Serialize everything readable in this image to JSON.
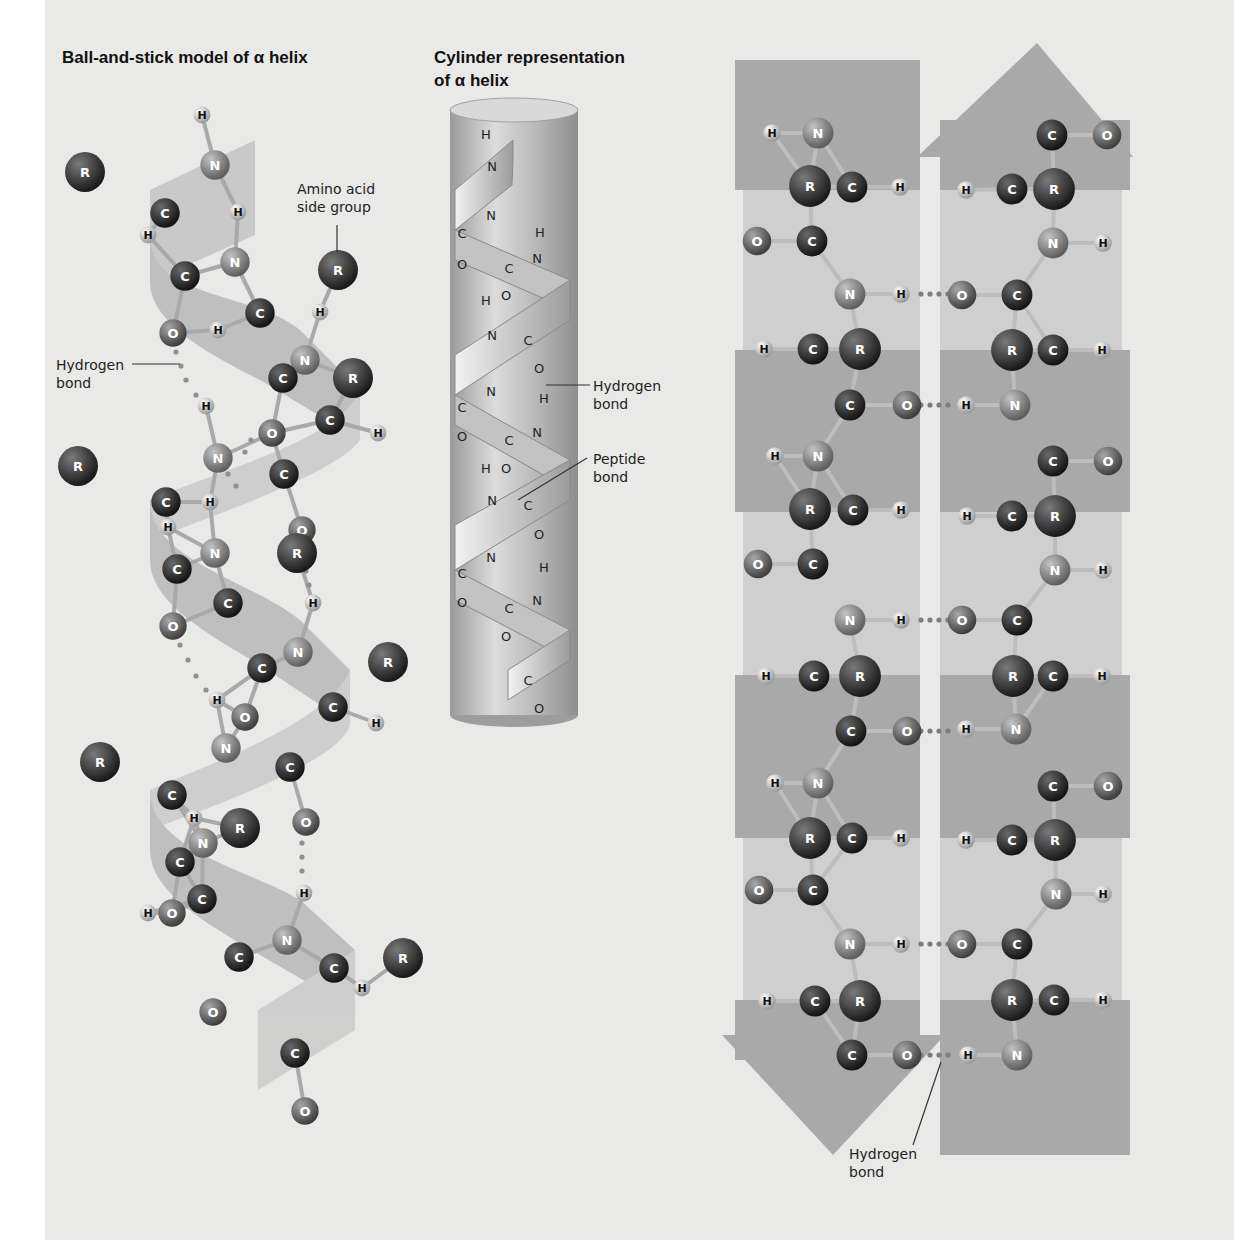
{
  "figure": {
    "panel_color": "#e9e9e8",
    "colors": {
      "carbon": "#2b2b2b",
      "nitrogen": "#8a8a8a",
      "oxygen": "#6e6e6e",
      "r_group": "#3a3a3a",
      "hydrogen": "#eeeeee",
      "ribbon": "#bdbdbd",
      "sheet_dark": "#a9a9a9",
      "sheet_light": "#cfcfcf",
      "cylinder": "#b8b8b8"
    }
  },
  "alpha_ball_stick": {
    "title": "Ball-and-stick model of α helix",
    "callouts": {
      "side_group": "Amino acid\nside group",
      "hydrogen_bond": "Hydrogen\nbond"
    },
    "atoms": [
      {
        "el": "H",
        "x": 202,
        "y": 115
      },
      {
        "el": "N",
        "x": 215,
        "y": 165
      },
      {
        "el": "R",
        "x": 85,
        "y": 172
      },
      {
        "el": "C",
        "x": 165,
        "y": 213
      },
      {
        "el": "H",
        "x": 148,
        "y": 235
      },
      {
        "el": "H",
        "x": 238,
        "y": 212
      },
      {
        "el": "N",
        "x": 235,
        "y": 262
      },
      {
        "el": "R",
        "x": 338,
        "y": 270
      },
      {
        "el": "C",
        "x": 185,
        "y": 276
      },
      {
        "el": "C",
        "x": 260,
        "y": 313
      },
      {
        "el": "H",
        "x": 320,
        "y": 312
      },
      {
        "el": "O",
        "x": 173,
        "y": 333
      },
      {
        "el": "H",
        "x": 218,
        "y": 330
      },
      {
        "el": "N",
        "x": 305,
        "y": 360
      },
      {
        "el": "R",
        "x": 353,
        "y": 378
      },
      {
        "el": "C",
        "x": 283,
        "y": 378
      },
      {
        "el": "C",
        "x": 330,
        "y": 420
      },
      {
        "el": "H",
        "x": 378,
        "y": 433
      },
      {
        "el": "H",
        "x": 206,
        "y": 406
      },
      {
        "el": "O",
        "x": 272,
        "y": 433
      },
      {
        "el": "N",
        "x": 218,
        "y": 458
      },
      {
        "el": "C",
        "x": 284,
        "y": 474
      },
      {
        "el": "R",
        "x": 78,
        "y": 466
      },
      {
        "el": "C",
        "x": 166,
        "y": 502
      },
      {
        "el": "H",
        "x": 210,
        "y": 502
      },
      {
        "el": "H",
        "x": 168,
        "y": 527
      },
      {
        "el": "O",
        "x": 302,
        "y": 530
      },
      {
        "el": "R",
        "x": 297,
        "y": 553
      },
      {
        "el": "N",
        "x": 215,
        "y": 553
      },
      {
        "el": "C",
        "x": 177,
        "y": 569
      },
      {
        "el": "C",
        "x": 228,
        "y": 603
      },
      {
        "el": "H",
        "x": 313,
        "y": 603
      },
      {
        "el": "O",
        "x": 173,
        "y": 626
      },
      {
        "el": "N",
        "x": 298,
        "y": 652
      },
      {
        "el": "R",
        "x": 388,
        "y": 662
      },
      {
        "el": "C",
        "x": 262,
        "y": 668
      },
      {
        "el": "C",
        "x": 333,
        "y": 707
      },
      {
        "el": "H",
        "x": 217,
        "y": 700
      },
      {
        "el": "H",
        "x": 376,
        "y": 723
      },
      {
        "el": "O",
        "x": 245,
        "y": 717
      },
      {
        "el": "N",
        "x": 226,
        "y": 748
      },
      {
        "el": "C",
        "x": 290,
        "y": 767
      },
      {
        "el": "R",
        "x": 100,
        "y": 762
      },
      {
        "el": "C",
        "x": 172,
        "y": 795
      },
      {
        "el": "H",
        "x": 194,
        "y": 818
      },
      {
        "el": "O",
        "x": 306,
        "y": 822
      },
      {
        "el": "R",
        "x": 240,
        "y": 828
      },
      {
        "el": "N",
        "x": 203,
        "y": 843
      },
      {
        "el": "C",
        "x": 180,
        "y": 862
      },
      {
        "el": "C",
        "x": 202,
        "y": 899
      },
      {
        "el": "O",
        "x": 172,
        "y": 913
      },
      {
        "el": "H",
        "x": 148,
        "y": 913
      },
      {
        "el": "H",
        "x": 304,
        "y": 893
      },
      {
        "el": "N",
        "x": 287,
        "y": 940
      },
      {
        "el": "C",
        "x": 239,
        "y": 957
      },
      {
        "el": "R",
        "x": 403,
        "y": 958
      },
      {
        "el": "C",
        "x": 334,
        "y": 968
      },
      {
        "el": "H",
        "x": 362,
        "y": 988
      },
      {
        "el": "O",
        "x": 213,
        "y": 1012
      },
      {
        "el": "C",
        "x": 295,
        "y": 1053
      },
      {
        "el": "O",
        "x": 305,
        "y": 1111
      }
    ]
  },
  "alpha_cylinder": {
    "title_line1": "Cylinder representation",
    "title_line2": "of α helix",
    "callouts": {
      "hydrogen_bond": "Hydrogen\nbond",
      "peptide_bond": "Peptide\nbond"
    }
  },
  "beta_sheet": {
    "callouts": {
      "hydrogen_bond": "Hydrogen\nbond"
    },
    "left_strand_direction": "down",
    "right_strand_direction": "up",
    "bands_y": [
      190,
      350,
      512,
      675,
      838,
      1000
    ],
    "atoms_left": [
      {
        "el": "H",
        "x": 772,
        "y": 133
      },
      {
        "el": "N",
        "x": 818,
        "y": 133
      },
      {
        "el": "R",
        "x": 810,
        "y": 186
      },
      {
        "el": "C",
        "x": 852,
        "y": 187
      },
      {
        "el": "H",
        "x": 900,
        "y": 187
      },
      {
        "el": "O",
        "x": 757,
        "y": 241
      },
      {
        "el": "C",
        "x": 812,
        "y": 241
      },
      {
        "el": "N",
        "x": 850,
        "y": 294
      },
      {
        "el": "H",
        "x": 901,
        "y": 294
      },
      {
        "el": "H",
        "x": 764,
        "y": 349
      },
      {
        "el": "C",
        "x": 813,
        "y": 349
      },
      {
        "el": "R",
        "x": 860,
        "y": 349
      },
      {
        "el": "C",
        "x": 850,
        "y": 405
      },
      {
        "el": "O",
        "x": 907,
        "y": 405
      },
      {
        "el": "H",
        "x": 775,
        "y": 456
      },
      {
        "el": "N",
        "x": 818,
        "y": 456
      },
      {
        "el": "R",
        "x": 810,
        "y": 509
      },
      {
        "el": "C",
        "x": 853,
        "y": 510
      },
      {
        "el": "H",
        "x": 901,
        "y": 510
      },
      {
        "el": "O",
        "x": 758,
        "y": 564
      },
      {
        "el": "C",
        "x": 813,
        "y": 564
      },
      {
        "el": "N",
        "x": 850,
        "y": 620
      },
      {
        "el": "H",
        "x": 901,
        "y": 620
      },
      {
        "el": "H",
        "x": 766,
        "y": 676
      },
      {
        "el": "C",
        "x": 814,
        "y": 676
      },
      {
        "el": "R",
        "x": 860,
        "y": 676
      },
      {
        "el": "C",
        "x": 851,
        "y": 731
      },
      {
        "el": "O",
        "x": 907,
        "y": 731
      },
      {
        "el": "H",
        "x": 775,
        "y": 783
      },
      {
        "el": "N",
        "x": 818,
        "y": 783
      },
      {
        "el": "R",
        "x": 810,
        "y": 838
      },
      {
        "el": "C",
        "x": 852,
        "y": 838
      },
      {
        "el": "H",
        "x": 901,
        "y": 838
      },
      {
        "el": "O",
        "x": 759,
        "y": 890
      },
      {
        "el": "C",
        "x": 813,
        "y": 890
      },
      {
        "el": "N",
        "x": 850,
        "y": 944
      },
      {
        "el": "H",
        "x": 901,
        "y": 944
      },
      {
        "el": "H",
        "x": 767,
        "y": 1001
      },
      {
        "el": "C",
        "x": 815,
        "y": 1001
      },
      {
        "el": "R",
        "x": 860,
        "y": 1001
      },
      {
        "el": "C",
        "x": 852,
        "y": 1055
      },
      {
        "el": "O",
        "x": 907,
        "y": 1055
      }
    ],
    "atoms_right": [
      {
        "el": "C",
        "x": 1052,
        "y": 135
      },
      {
        "el": "O",
        "x": 1107,
        "y": 135
      },
      {
        "el": "H",
        "x": 966,
        "y": 190
      },
      {
        "el": "C",
        "x": 1012,
        "y": 189
      },
      {
        "el": "R",
        "x": 1054,
        "y": 189
      },
      {
        "el": "N",
        "x": 1053,
        "y": 243
      },
      {
        "el": "H",
        "x": 1103,
        "y": 243
      },
      {
        "el": "O",
        "x": 962,
        "y": 295
      },
      {
        "el": "C",
        "x": 1017,
        "y": 295
      },
      {
        "el": "R",
        "x": 1012,
        "y": 350
      },
      {
        "el": "C",
        "x": 1053,
        "y": 350
      },
      {
        "el": "H",
        "x": 1102,
        "y": 350
      },
      {
        "el": "H",
        "x": 966,
        "y": 405
      },
      {
        "el": "N",
        "x": 1015,
        "y": 405
      },
      {
        "el": "C",
        "x": 1053,
        "y": 461
      },
      {
        "el": "O",
        "x": 1108,
        "y": 461
      },
      {
        "el": "H",
        "x": 967,
        "y": 516
      },
      {
        "el": "C",
        "x": 1012,
        "y": 516
      },
      {
        "el": "R",
        "x": 1055,
        "y": 516
      },
      {
        "el": "N",
        "x": 1055,
        "y": 570
      },
      {
        "el": "H",
        "x": 1103,
        "y": 570
      },
      {
        "el": "O",
        "x": 962,
        "y": 620
      },
      {
        "el": "C",
        "x": 1017,
        "y": 620
      },
      {
        "el": "R",
        "x": 1013,
        "y": 676
      },
      {
        "el": "C",
        "x": 1053,
        "y": 676
      },
      {
        "el": "H",
        "x": 1102,
        "y": 676
      },
      {
        "el": "H",
        "x": 966,
        "y": 729
      },
      {
        "el": "N",
        "x": 1016,
        "y": 729
      },
      {
        "el": "C",
        "x": 1053,
        "y": 786
      },
      {
        "el": "O",
        "x": 1108,
        "y": 786
      },
      {
        "el": "H",
        "x": 966,
        "y": 840
      },
      {
        "el": "C",
        "x": 1012,
        "y": 840
      },
      {
        "el": "R",
        "x": 1055,
        "y": 840
      },
      {
        "el": "N",
        "x": 1056,
        "y": 894
      },
      {
        "el": "H",
        "x": 1103,
        "y": 894
      },
      {
        "el": "O",
        "x": 962,
        "y": 944
      },
      {
        "el": "C",
        "x": 1017,
        "y": 944
      },
      {
        "el": "R",
        "x": 1012,
        "y": 1000
      },
      {
        "el": "C",
        "x": 1054,
        "y": 1000
      },
      {
        "el": "H",
        "x": 1103,
        "y": 1000
      },
      {
        "el": "H",
        "x": 968,
        "y": 1055
      },
      {
        "el": "N",
        "x": 1017,
        "y": 1055
      }
    ],
    "hbonds_y": [
      294,
      405,
      620,
      731,
      944,
      1055
    ]
  }
}
